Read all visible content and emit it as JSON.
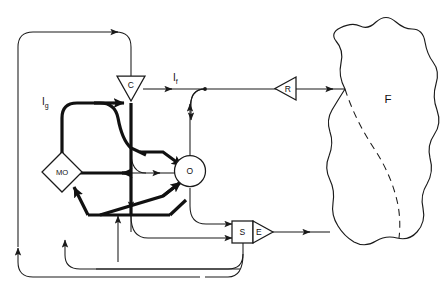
{
  "diagram": {
    "background_color": "#ffffff",
    "line_color": "#1a1a1a",
    "nodes": [
      {
        "id": "C",
        "label": "C",
        "shape": "triangle-down",
        "x": 131,
        "y": 89
      },
      {
        "id": "MO",
        "label": "MO",
        "shape": "diamond",
        "x": 62,
        "y": 172
      },
      {
        "id": "O",
        "label": "O",
        "shape": "circle",
        "x": 190,
        "y": 171
      },
      {
        "id": "S",
        "label": "S",
        "shape": "rectangle",
        "x": 243,
        "y": 232
      },
      {
        "id": "E",
        "label": "E",
        "shape": "triangle-right",
        "x": 259,
        "y": 232
      },
      {
        "id": "R",
        "label": "R",
        "shape": "triangle-left",
        "x": 285,
        "y": 88
      },
      {
        "id": "F",
        "label": "F",
        "shape": "blob",
        "x": 388,
        "y": 99
      }
    ],
    "edge_labels": [
      {
        "id": "If",
        "base": "I",
        "subscript": "f",
        "x": 173,
        "y": 80
      },
      {
        "id": "Ig",
        "base": "I",
        "subscript": "g",
        "x": 44,
        "y": 104
      }
    ]
  }
}
